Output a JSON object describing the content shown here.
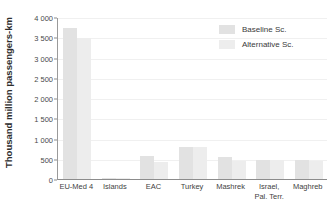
{
  "chart_data": {
    "type": "bar",
    "title": "",
    "xlabel": "",
    "ylabel": "Thousand million passengers-km",
    "ylim": [
      0,
      4000
    ],
    "yticks": [
      0,
      500,
      1000,
      1500,
      2000,
      2500,
      3000,
      3500,
      4000
    ],
    "ytick_labels": [
      "0",
      "500",
      "1 000",
      "1 500",
      "2 000",
      "2 500",
      "3 000",
      "3 500",
      "4 000"
    ],
    "grid": true,
    "legend_position": "top-right",
    "categories": [
      "EU-Med 4",
      "Islands",
      "EAC",
      "Turkey",
      "Mashrek",
      "Israel, Pal. Terr.",
      "Maghreb"
    ],
    "category_label_lines": [
      [
        "EU-Med 4"
      ],
      [
        "Islands"
      ],
      [
        "EAC"
      ],
      [
        "Turkey"
      ],
      [
        "Mashrek"
      ],
      [
        "Israel,",
        "Pal. Terr."
      ],
      [
        "Maghreb"
      ]
    ],
    "series": [
      {
        "name": "Baseline Sc.",
        "color": "#e2e2e2",
        "values": [
          3720,
          25,
          560,
          780,
          540,
          480,
          480
        ]
      },
      {
        "name": "Alternative Sc.",
        "color": "#ededed",
        "values": [
          3490,
          20,
          410,
          780,
          450,
          470,
          450
        ]
      }
    ]
  },
  "legend": {
    "items": [
      {
        "label": "Baseline Sc."
      },
      {
        "label": "Alternative Sc."
      }
    ]
  },
  "colors": {
    "baseline": "#e2e2e2",
    "alternative": "#ededed",
    "axis": "#8c8c8c",
    "grid": "#f0f0f0",
    "text": "#3a3a3a",
    "background": "#ffffff"
  }
}
